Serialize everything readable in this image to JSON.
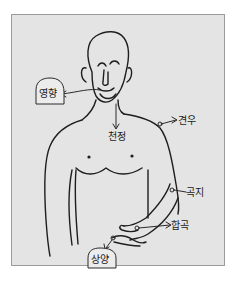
{
  "diagram": {
    "labels": {
      "yeonghyang": "영향",
      "cheonjeong": "천정",
      "gyeonu": "견우",
      "gokji": "곡지",
      "hapgok": "합곡",
      "sangyang": "상양"
    },
    "colors": {
      "background": "#ffffff",
      "panel": "#e4e4e4",
      "ink": "#1e1e1e"
    }
  }
}
